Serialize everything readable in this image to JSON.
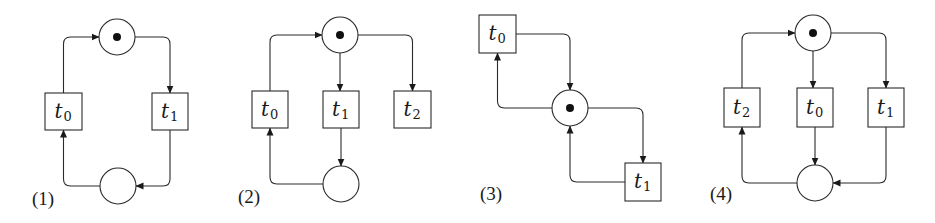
{
  "figure": {
    "width": 935,
    "height": 223,
    "stroke_color": "#2a2a2a",
    "token_color": "#111111",
    "place_radius": 18,
    "token_radius": 4
  },
  "diagrams": [
    {
      "id": "1",
      "label": "(1)",
      "label_pos": [
        32,
        205
      ],
      "places": [
        {
          "id": "p_top",
          "cx": 117,
          "cy": 37,
          "tokens": 1
        },
        {
          "id": "p_bottom",
          "cx": 118,
          "cy": 186,
          "tokens": 0
        }
      ],
      "transitions": [
        {
          "id": "t0",
          "name": "t",
          "sub": "0",
          "x": 45,
          "y": 93,
          "w": 37,
          "h": 37
        },
        {
          "id": "t1",
          "name": "t",
          "sub": "1",
          "x": 152,
          "y": 93,
          "w": 36,
          "h": 37
        }
      ],
      "arcs": [
        {
          "from": "t0",
          "to": "p_top",
          "path": "M63.5,93 L63.5,44 Q63.5,37 70.5,37 L99,37"
        },
        {
          "from": "p_top",
          "to": "t1",
          "path": "M135,37 L163,37 Q170,37 170,44 L170,93"
        },
        {
          "from": "t1",
          "to": "p_bottom",
          "path": "M170,130 L170,179 Q170,186 163,186 L136,186"
        },
        {
          "from": "p_bottom",
          "to": "t0",
          "path": "M100,186 L70.5,186 Q63.5,186 63.5,179 L63.5,130"
        }
      ]
    },
    {
      "id": "2",
      "label": "(2)",
      "label_pos": [
        238,
        203
      ],
      "places": [
        {
          "id": "p_top",
          "cx": 340,
          "cy": 35,
          "tokens": 1
        },
        {
          "id": "p_bottom",
          "cx": 341,
          "cy": 184,
          "tokens": 0
        }
      ],
      "transitions": [
        {
          "id": "t0",
          "name": "t",
          "sub": "0",
          "x": 252,
          "y": 91,
          "w": 36,
          "h": 37
        },
        {
          "id": "t1",
          "name": "t",
          "sub": "1",
          "x": 323,
          "y": 91,
          "w": 36,
          "h": 37
        },
        {
          "id": "t2",
          "name": "t",
          "sub": "2",
          "x": 394,
          "y": 91,
          "w": 37,
          "h": 37
        }
      ],
      "arcs": [
        {
          "from": "t0",
          "to": "p_top",
          "path": "M270,91 L270,42 Q270,35 277,35 L322,35"
        },
        {
          "from": "p_top",
          "to": "t1",
          "path": "M340,53 L340,91"
        },
        {
          "from": "p_top",
          "to": "t2",
          "path": "M358,35 L405.5,35 Q412.5,35 412.5,42 L412.5,91"
        },
        {
          "from": "t1",
          "to": "p_bottom",
          "path": "M341,128 L341,166"
        },
        {
          "from": "p_bottom",
          "to": "t0",
          "path": "M323,184 L277,184 Q270,184 270,177 L270,128"
        }
      ]
    },
    {
      "id": "3",
      "label": "(3)",
      "label_pos": [
        480,
        200
      ],
      "places": [
        {
          "id": "p_center",
          "cx": 570,
          "cy": 108,
          "tokens": 1
        }
      ],
      "transitions": [
        {
          "id": "t0",
          "name": "t",
          "sub": "0",
          "x": 479,
          "y": 15,
          "w": 37,
          "h": 38
        },
        {
          "id": "t1",
          "name": "t",
          "sub": "1",
          "x": 625,
          "y": 163,
          "w": 36,
          "h": 38
        }
      ],
      "arcs": [
        {
          "from": "t0",
          "to": "p_center",
          "path": "M516,34 L563,34 Q570,34 570,41 L570,90"
        },
        {
          "from": "p_center",
          "to": "t0",
          "path": "M552,108 L504.5,108 Q497.5,108 497.5,101 L497.5,53"
        },
        {
          "from": "p_center",
          "to": "t1",
          "path": "M588,108 L636,108 Q643,108 643,115 L643,163"
        },
        {
          "from": "t1",
          "to": "p_center",
          "path": "M625,182 L577,182 Q570,182 570,175 L570,126"
        }
      ]
    },
    {
      "id": "4",
      "label": "(4)",
      "label_pos": [
        710,
        200
      ],
      "places": [
        {
          "id": "p_top",
          "cx": 813,
          "cy": 33,
          "tokens": 1
        },
        {
          "id": "p_bottom",
          "cx": 815,
          "cy": 183,
          "tokens": 0
        }
      ],
      "transitions": [
        {
          "id": "t2",
          "name": "t",
          "sub": "2",
          "x": 724,
          "y": 88,
          "w": 36,
          "h": 39
        },
        {
          "id": "t0",
          "name": "t",
          "sub": "0",
          "x": 797,
          "y": 88,
          "w": 36,
          "h": 39
        },
        {
          "id": "t1",
          "name": "t",
          "sub": "1",
          "x": 868,
          "y": 88,
          "w": 36,
          "h": 39
        }
      ],
      "arcs": [
        {
          "from": "t2",
          "to": "p_top",
          "path": "M742,88 L742,40 Q742,33 749,33 L795,33"
        },
        {
          "from": "p_top",
          "to": "t0",
          "path": "M813,51 L813,88"
        },
        {
          "from": "p_top",
          "to": "t1",
          "path": "M831,33 L879,33 Q886,33 886,40 L886,88"
        },
        {
          "from": "t0",
          "to": "p_bottom",
          "path": "M815,127 L815,165"
        },
        {
          "from": "t1",
          "to": "p_bottom",
          "path": "M886,127 L886,176 Q886,183 879,183 L833,183"
        },
        {
          "from": "p_bottom",
          "to": "t2",
          "path": "M797,183 L749,183 Q742,183 742,176 L742,127"
        }
      ]
    }
  ]
}
